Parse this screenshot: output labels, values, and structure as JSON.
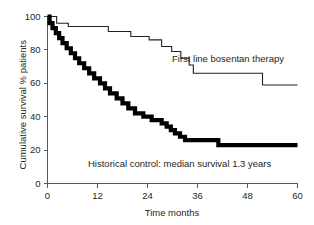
{
  "chart_data": {
    "type": "line",
    "title": "",
    "subtitle": "",
    "xlabel": "Time months",
    "ylabel": "Cumulative survival % patients",
    "xlim": [
      0,
      60
    ],
    "ylim": [
      0,
      100
    ],
    "xticks": [
      0,
      12,
      24,
      36,
      48,
      60
    ],
    "xticklabels": [
      "0",
      "12",
      "24",
      "36",
      "48",
      "60"
    ],
    "yticks": [
      0,
      20,
      40,
      60,
      80,
      100
    ],
    "yticklabels": [
      "0",
      "20",
      "40",
      "60",
      "80",
      "100"
    ],
    "grid": false,
    "legend_position": "inline-annotation",
    "step_type": "kaplan-meier",
    "series": [
      {
        "name": "First line bosentan therapy",
        "annotation": "First line bosentan therapy",
        "style": "thin-step-line",
        "color": "#231f20",
        "linewidth_px": 1.1,
        "points": [
          [
            0,
            100
          ],
          [
            2.2,
            100
          ],
          [
            2.2,
            96
          ],
          [
            5.0,
            96
          ],
          [
            5.0,
            94
          ],
          [
            14.6,
            94
          ],
          [
            14.6,
            91
          ],
          [
            20.0,
            91
          ],
          [
            20.0,
            88
          ],
          [
            24.4,
            88
          ],
          [
            24.4,
            86
          ],
          [
            27.4,
            86
          ],
          [
            27.4,
            82
          ],
          [
            29.8,
            82
          ],
          [
            29.8,
            79
          ],
          [
            32.0,
            79
          ],
          [
            32.0,
            75
          ],
          [
            34.0,
            75
          ],
          [
            34.0,
            71
          ],
          [
            35.0,
            71
          ],
          [
            35.0,
            66
          ],
          [
            51.6,
            66
          ],
          [
            51.6,
            59
          ],
          [
            60,
            59
          ]
        ]
      },
      {
        "name": "Historical control: median survival 1.3 years",
        "annotation": "Historical control: median survival 1.3 years",
        "style": "thick-step-line",
        "color": "#000000",
        "linewidth_px": 4.2,
        "median_survival_years": 1.3,
        "points": [
          [
            0,
            100
          ],
          [
            0.5,
            100
          ],
          [
            0.5,
            96
          ],
          [
            1.2,
            96
          ],
          [
            1.2,
            93
          ],
          [
            2.0,
            93
          ],
          [
            2.0,
            90
          ],
          [
            2.8,
            90
          ],
          [
            2.8,
            87
          ],
          [
            3.6,
            87
          ],
          [
            3.6,
            84
          ],
          [
            4.6,
            84
          ],
          [
            4.6,
            81
          ],
          [
            5.6,
            81
          ],
          [
            5.6,
            78
          ],
          [
            6.6,
            78
          ],
          [
            6.6,
            75
          ],
          [
            7.6,
            75
          ],
          [
            7.6,
            72
          ],
          [
            8.8,
            72
          ],
          [
            8.8,
            69
          ],
          [
            10.0,
            69
          ],
          [
            10.0,
            66
          ],
          [
            11.2,
            66
          ],
          [
            11.2,
            63
          ],
          [
            12.6,
            63
          ],
          [
            12.6,
            60
          ],
          [
            13.8,
            60
          ],
          [
            13.8,
            57
          ],
          [
            15.0,
            57
          ],
          [
            15.0,
            54
          ],
          [
            16.6,
            54
          ],
          [
            16.6,
            51
          ],
          [
            18.0,
            51
          ],
          [
            18.0,
            48
          ],
          [
            19.4,
            48
          ],
          [
            19.4,
            45
          ],
          [
            21.0,
            45
          ],
          [
            21.0,
            42
          ],
          [
            23.0,
            42
          ],
          [
            23.0,
            40
          ],
          [
            25.0,
            40
          ],
          [
            25.0,
            38
          ],
          [
            27.4,
            38
          ],
          [
            27.4,
            36
          ],
          [
            28.6,
            36
          ],
          [
            28.6,
            34
          ],
          [
            29.6,
            34
          ],
          [
            29.6,
            32
          ],
          [
            30.6,
            32
          ],
          [
            30.6,
            30
          ],
          [
            31.8,
            30
          ],
          [
            31.8,
            28
          ],
          [
            33.0,
            28
          ],
          [
            33.0,
            26
          ],
          [
            41.0,
            26
          ],
          [
            41.0,
            23
          ],
          [
            60,
            23
          ]
        ]
      }
    ]
  },
  "axis": {
    "x_title": "Time months",
    "y_title": "Cumulative survival % patients",
    "x_tick_labels": [
      "0",
      "12",
      "24",
      "36",
      "48",
      "60"
    ],
    "y_tick_labels": [
      "0",
      "20",
      "40",
      "60",
      "80",
      "100"
    ]
  },
  "annotations": {
    "treatment": "First line bosentan therapy",
    "control": "Historical control: median survival 1.3 years"
  },
  "colors": {
    "axis": "#58595b",
    "text": "#231f20",
    "treatment_line": "#231f20",
    "control_line": "#000000",
    "background": "#ffffff"
  }
}
